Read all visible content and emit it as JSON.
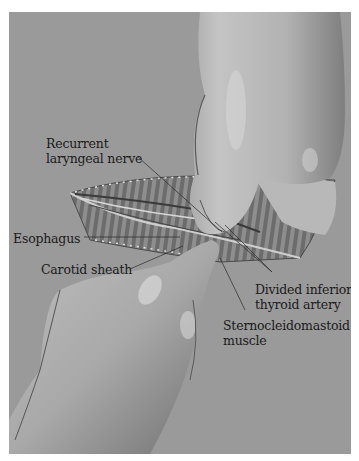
{
  "figure": {
    "background_color": "#9a9a9a",
    "labels": [
      {
        "id": "recurrent-laryngeal-nerve",
        "lines": [
          "Recurrent",
          "laryngeal nerve"
        ]
      },
      {
        "id": "esophagus",
        "lines": [
          "Esophagus"
        ]
      },
      {
        "id": "carotid-sheath",
        "lines": [
          "Carotid sheath"
        ]
      },
      {
        "id": "divided-inferior-thyroid-artery",
        "lines": [
          "Divided inferior",
          "thyroid artery"
        ]
      },
      {
        "id": "sternocleidomastoid-muscle",
        "lines": [
          "Sternocleidomastoid",
          "muscle"
        ]
      }
    ]
  }
}
